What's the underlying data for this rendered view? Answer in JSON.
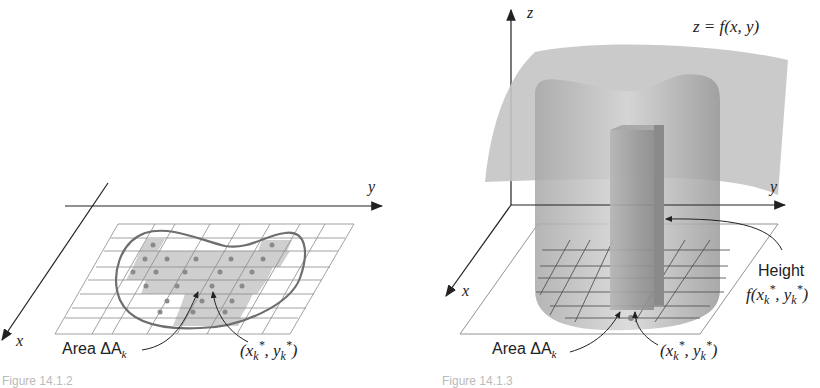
{
  "left_figure": {
    "axes": {
      "x_label": "x",
      "y_label": "y"
    },
    "labels": {
      "area_prefix": "Area ",
      "area_symbol": "ΔA",
      "area_sub": "k",
      "point": "(x",
      "point_sub1": "k",
      "point_sup1": "*",
      "point_mid": ", y",
      "point_sub2": "k",
      "point_sup2": "*",
      "point_end": ")"
    },
    "caption": "Figure 14.1.2"
  },
  "right_figure": {
    "axes": {
      "x_label": "x",
      "y_label": "y",
      "z_label": "z"
    },
    "surface_label": "z = f(x, y)",
    "height_label": "Height",
    "height_expr": "f(x",
    "height_expr_sub1": "k",
    "height_expr_sup1": "*",
    "height_expr_mid": ", y",
    "height_expr_sub2": "k",
    "height_expr_sup2": "*",
    "height_expr_end": ")",
    "labels": {
      "area_prefix": "Area ",
      "area_symbol": "ΔA",
      "area_sub": "k",
      "point": "(x",
      "point_sub1": "k",
      "point_sup1": "*",
      "point_mid": ", y",
      "point_sub2": "k",
      "point_sup2": "*",
      "point_end": ")"
    },
    "caption": "Figure 14.1.3"
  },
  "colors": {
    "shaded_cells": "#cfcfcf",
    "sample_dots": "#8a8a8a",
    "region_outline": "#6e6e6e",
    "surface": "#bdbdbd",
    "solid": "#9e9e9e"
  }
}
